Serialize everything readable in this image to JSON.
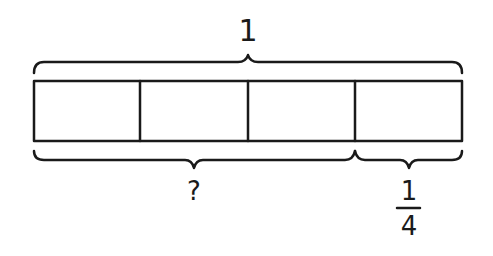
{
  "diagram": {
    "type": "tape-diagram",
    "total_label": "1",
    "parts": 4,
    "unknown_label": "?",
    "known_fraction": {
      "numerator": "1",
      "denominator": "4"
    },
    "stroke_color": "#1a1a1a"
  }
}
